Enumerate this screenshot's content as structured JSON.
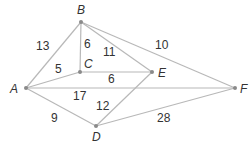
{
  "graph": {
    "nodes": [
      {
        "id": "A",
        "x": 26,
        "y": 88,
        "lx": 10,
        "ly": 93
      },
      {
        "id": "B",
        "x": 81,
        "y": 22,
        "lx": 77,
        "ly": 14
      },
      {
        "id": "C",
        "x": 80,
        "y": 72,
        "lx": 84,
        "ly": 68
      },
      {
        "id": "D",
        "x": 96,
        "y": 126,
        "lx": 92,
        "ly": 141
      },
      {
        "id": "E",
        "x": 152,
        "y": 72,
        "lx": 158,
        "ly": 77
      },
      {
        "id": "F",
        "x": 235,
        "y": 88,
        "lx": 240,
        "ly": 93
      }
    ],
    "edges": [
      {
        "from": "A",
        "to": "B",
        "weight": "13",
        "lx": 36,
        "ly": 50
      },
      {
        "from": "B",
        "to": "C",
        "weight": "6",
        "lx": 84,
        "ly": 48
      },
      {
        "from": "B",
        "to": "E",
        "weight": "11",
        "lx": 103,
        "ly": 56
      },
      {
        "from": "B",
        "to": "F",
        "weight": "10",
        "lx": 155,
        "ly": 49
      },
      {
        "from": "A",
        "to": "C",
        "weight": "5",
        "lx": 55,
        "ly": 73
      },
      {
        "from": "C",
        "to": "E",
        "weight": "6",
        "lx": 108,
        "ly": 83
      },
      {
        "from": "A",
        "to": "F",
        "weight": "17",
        "lx": 73,
        "ly": 100
      },
      {
        "from": "D",
        "to": "E",
        "weight": "12",
        "lx": 96,
        "ly": 110
      },
      {
        "from": "A",
        "to": "D",
        "weight": "9",
        "lx": 51,
        "ly": 122
      },
      {
        "from": "D",
        "to": "F",
        "weight": "28",
        "lx": 157,
        "ly": 122
      }
    ]
  }
}
